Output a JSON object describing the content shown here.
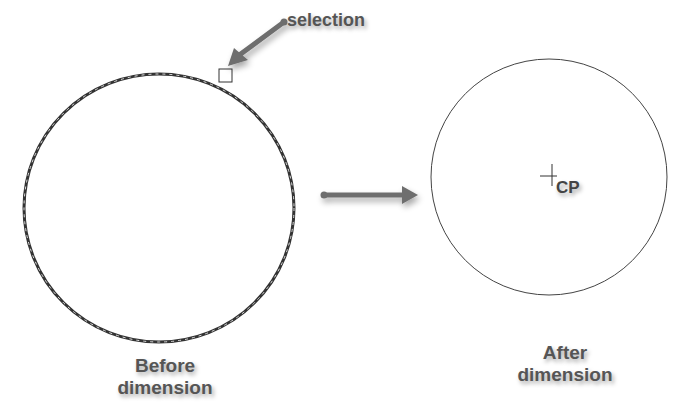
{
  "annotations": {
    "selection": "selection",
    "center_point": "CP"
  },
  "labels": {
    "before_line1": "Before",
    "before_line2": "dimension",
    "after_line1": "After",
    "after_line2": "dimension"
  },
  "colors": {
    "arrow": "#6e6e6e",
    "circle_before": "#333333",
    "circle_after": "#444444",
    "text": "#555555"
  }
}
